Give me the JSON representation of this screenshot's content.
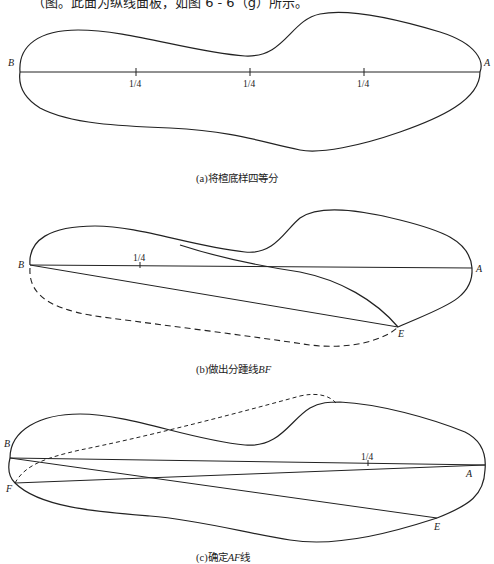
{
  "header_text": "（图。此面为纵线面板，如图 6 - 6（g）所示。",
  "panels": [
    {
      "id": "a",
      "caption_prefix": "(a)将楦底样四等分",
      "caption_italic": "",
      "points": {
        "B": "B",
        "A": "A"
      },
      "tick_labels": [
        "1/4",
        "1/4",
        "1/4"
      ]
    },
    {
      "id": "b",
      "caption_prefix": "(b)做出分踵线",
      "caption_italic": "BF",
      "points": {
        "B": "B",
        "A": "A",
        "E": "E"
      },
      "tick_labels": [
        "1/4"
      ]
    },
    {
      "id": "c",
      "caption_prefix": "(c)确定",
      "caption_italic": "AF",
      "caption_suffix": "线",
      "points": {
        "B": "B",
        "A": "A",
        "E": "E",
        "F": "F"
      },
      "tick_labels": [
        "1/4"
      ]
    }
  ],
  "colors": {
    "line": "#222222",
    "background": "#ffffff"
  }
}
